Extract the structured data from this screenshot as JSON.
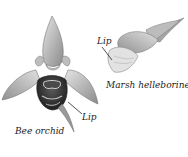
{
  "figure": {
    "labels": {
      "bee_orchid": "Bee orchid",
      "bee_orchid_lip": "Lip",
      "marsh_helleborine": "Marsh helleborine",
      "marsh_helleborine_lip": "Lip"
    },
    "colors": {
      "ink": "#222222",
      "petal_light": "#d9d9d9",
      "petal_mid": "#a8a8a8",
      "petal_dark": "#6e6e6e",
      "lip_dark": "#2e2e2e"
    }
  }
}
